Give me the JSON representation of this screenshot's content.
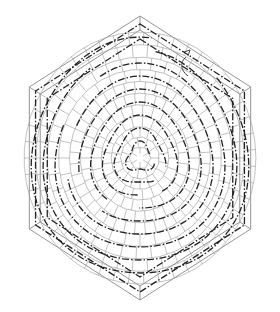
{
  "figure": {
    "type": "patent-drawing",
    "colors": {
      "background": "#ffffff",
      "frame_line": "#8a8a8a",
      "cell_line": "#9a9a9a",
      "flow_line": "#222222"
    },
    "reference_marker": {
      "label": "",
      "icon": "curved-arrow-icon"
    },
    "outer_hexagon": {
      "center": [
        140,
        158
      ],
      "radius": 142
    },
    "inner_hexagon": {
      "center": [
        140,
        158
      ],
      "radius": 128
    },
    "cell_rings": 11,
    "flow_rings": 9
  }
}
